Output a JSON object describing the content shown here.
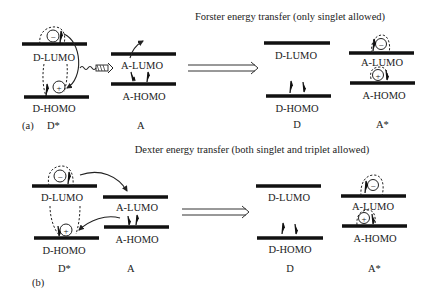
{
  "panel_a": {
    "title": "Forster energy transfer (only singlet allowed)",
    "tag": "(a)",
    "left": {
      "lumo": "D-LUMO",
      "homo": "D-HOMO",
      "species": "D*"
    },
    "acceptor": {
      "lumo": "A-LUMO",
      "homo": "A-HOMO",
      "species": "A"
    },
    "right_donor": {
      "lumo": "D-LUMO",
      "homo": "D-HOMO",
      "species": "D"
    },
    "right_acceptor": {
      "lumo": "A-LUMO",
      "homo": "A-HOMO",
      "species": "A*"
    }
  },
  "panel_b": {
    "title": "Dexter energy transfer (both singlet and triplet allowed)",
    "tag": "(b)",
    "left": {
      "lumo": "D-LUMO",
      "homo": "D-HOMO",
      "species": "D*"
    },
    "acceptor": {
      "lumo": "A-LUMO",
      "homo": "A-HOMO",
      "species": "A"
    },
    "right_donor": {
      "lumo": "D-LUMO",
      "homo": "D-HOMO",
      "species": "D"
    },
    "right_acceptor": {
      "lumo": "A-LUMO",
      "homo": "A-HOMO",
      "species": "A*"
    }
  },
  "symbols": {
    "electron": "−",
    "hole": "+"
  }
}
